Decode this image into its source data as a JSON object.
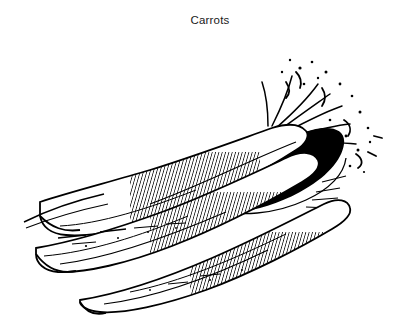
{
  "document": {
    "title": "Carrots",
    "background_color": "#ffffff",
    "ink_color": "#000000"
  },
  "figure": {
    "caption": "Carrots",
    "caption_position": "top-center",
    "style": "pen-and-ink line engraving",
    "elements": [
      {
        "name": "carrot-upper",
        "label": "Carrot"
      },
      {
        "name": "carrot-middle",
        "label": "Carrot"
      },
      {
        "name": "carrot-lower",
        "label": "Carrot"
      },
      {
        "name": "carrot-tops",
        "label": "Cut greens"
      },
      {
        "name": "cast-shadow",
        "label": "Shadow"
      },
      {
        "name": "ground-line",
        "label": "Ground"
      }
    ]
  }
}
